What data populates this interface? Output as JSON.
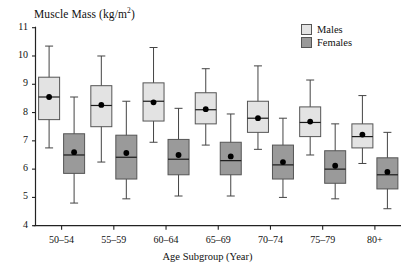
{
  "chart_data": {
    "type": "box",
    "title_main": "Muscle Mass (kg/m",
    "title_sup": "2",
    "title_tail": ")",
    "xlabel": "Age Subgroup (Year)",
    "ylabel": "Muscle Mass (kg/m2)",
    "ylim": [
      4,
      11
    ],
    "yticks": [
      4,
      5,
      6,
      7,
      8,
      9,
      10,
      11
    ],
    "ytick_labels": [
      "4",
      "5",
      "6",
      "7",
      "8",
      "9",
      "10",
      "11"
    ],
    "grid": false,
    "legend_position": "top-right",
    "categories": [
      "50–54",
      "55–59",
      "60–64",
      "65–69",
      "70–74",
      "75–79",
      "80+"
    ],
    "legend": [
      {
        "name": "Males",
        "color": "#e3e3e3"
      },
      {
        "name": "Females",
        "color": "#9a9a9a"
      }
    ],
    "series": [
      {
        "name": "Males",
        "color": "#e3e3e3",
        "boxes": [
          {
            "category": "50–54",
            "whisker_low": 6.75,
            "q1": 7.75,
            "median": 8.55,
            "mean": 8.55,
            "q3": 9.25,
            "whisker_high": 10.35
          },
          {
            "category": "55–59",
            "whisker_low": 6.25,
            "q1": 7.5,
            "median": 8.25,
            "mean": 8.27,
            "q3": 8.95,
            "whisker_high": 10.0
          },
          {
            "category": "60–64",
            "whisker_low": 6.95,
            "q1": 7.7,
            "median": 8.4,
            "mean": 8.36,
            "q3": 9.05,
            "whisker_high": 10.3
          },
          {
            "category": "65–69",
            "whisker_low": 6.85,
            "q1": 7.6,
            "median": 8.1,
            "mean": 8.12,
            "q3": 8.7,
            "whisker_high": 9.55
          },
          {
            "category": "70–74",
            "whisker_low": 6.7,
            "q1": 7.3,
            "median": 7.8,
            "mean": 7.8,
            "q3": 8.4,
            "whisker_high": 9.65
          },
          {
            "category": "75–79",
            "whisker_low": 6.5,
            "q1": 7.15,
            "median": 7.65,
            "mean": 7.68,
            "q3": 8.2,
            "whisker_high": 9.15
          },
          {
            "category": "80+",
            "whisker_low": 6.2,
            "q1": 6.75,
            "median": 7.15,
            "mean": 7.22,
            "q3": 7.6,
            "whisker_high": 8.6
          }
        ]
      },
      {
        "name": "Females",
        "color": "#9a9a9a",
        "boxes": [
          {
            "category": "50–54",
            "whisker_low": 4.8,
            "q1": 5.85,
            "median": 6.5,
            "mean": 6.6,
            "q3": 7.25,
            "whisker_high": 8.55
          },
          {
            "category": "55–59",
            "whisker_low": 4.95,
            "q1": 5.65,
            "median": 6.42,
            "mean": 6.57,
            "q3": 7.2,
            "whisker_high": 8.4
          },
          {
            "category": "60–64",
            "whisker_low": 5.05,
            "q1": 5.8,
            "median": 6.35,
            "mean": 6.5,
            "q3": 7.05,
            "whisker_high": 8.15
          },
          {
            "category": "65–69",
            "whisker_low": 5.05,
            "q1": 5.8,
            "median": 6.3,
            "mean": 6.45,
            "q3": 6.95,
            "whisker_high": 7.95
          },
          {
            "category": "70–74",
            "whisker_low": 5.0,
            "q1": 5.65,
            "median": 6.15,
            "mean": 6.25,
            "q3": 6.85,
            "whisker_high": 7.8
          },
          {
            "category": "75–79",
            "whisker_low": 4.95,
            "q1": 5.5,
            "median": 6.0,
            "mean": 6.12,
            "q3": 6.65,
            "whisker_high": 7.6
          },
          {
            "category": "80+",
            "whisker_low": 4.6,
            "q1": 5.3,
            "median": 5.8,
            "mean": 5.9,
            "q3": 6.4,
            "whisker_high": 7.3
          }
        ]
      }
    ]
  },
  "axes": {
    "y_axis_name": "y-axis",
    "x_axis_name": "x-axis"
  }
}
